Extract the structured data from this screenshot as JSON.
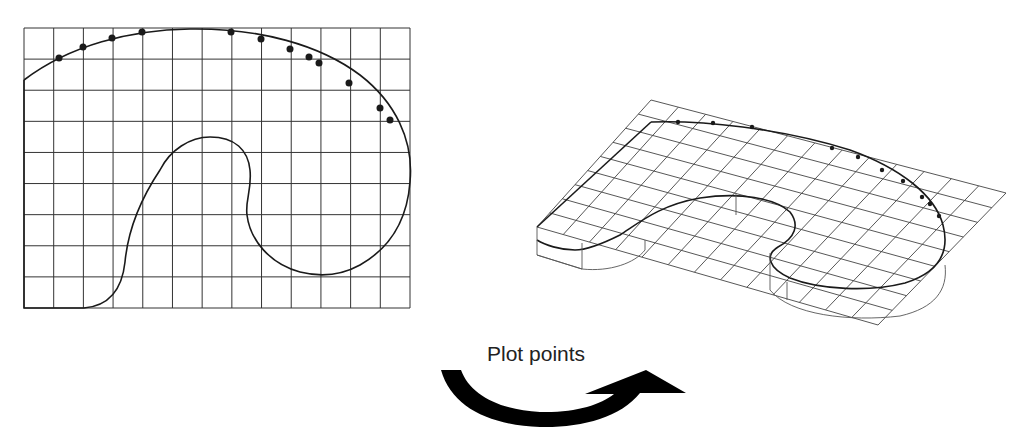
{
  "diagram": {
    "label": "Plot points",
    "colors": {
      "grid": "#333333",
      "curve": "#1a1a1a",
      "arrow": "#000000",
      "background": "#ffffff"
    },
    "flat_grid": {
      "columns": 13,
      "rows": 9,
      "plotted_points_count": 13
    },
    "projected_grid": {
      "columns": 13,
      "rows": 9
    },
    "arrow": {
      "icon": "curved-arrow-right-icon",
      "direction": "left-to-right"
    }
  }
}
